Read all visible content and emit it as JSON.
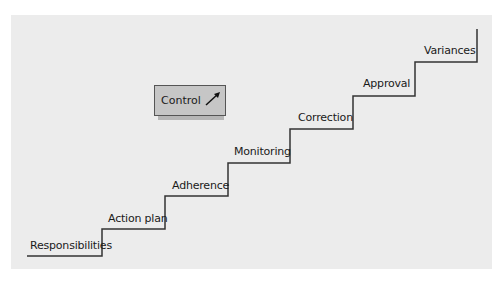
{
  "diagram": {
    "type": "staircase",
    "control_label": "Control",
    "control_icon": "arrow-up-right-icon",
    "steps": [
      {
        "label": "Responsibilities"
      },
      {
        "label": "Action plan"
      },
      {
        "label": "Adherence"
      },
      {
        "label": "Monitoring"
      },
      {
        "label": "Correction"
      },
      {
        "label": "Approval"
      },
      {
        "label": "Variances"
      }
    ],
    "colors": {
      "background": "#ececec",
      "line": "#333333",
      "control_fill": "#c6c6c6"
    }
  }
}
